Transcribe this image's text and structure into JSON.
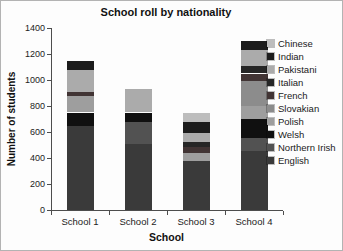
{
  "chart_data": {
    "type": "bar",
    "stacked": true,
    "title": "School roll by nationality",
    "xlabel": "School",
    "ylabel": "Number of students",
    "ylim": [
      0,
      1400
    ],
    "y_ticks": [
      1400,
      1200,
      1000,
      800,
      600,
      400,
      200,
      0
    ],
    "grid": false,
    "legend_position": "right",
    "legend_order_top_to_bottom": [
      "Chinese",
      "Indian",
      "Pakistani",
      "Italian",
      "French",
      "Slovakian",
      "Polish",
      "Welsh",
      "Northern Irish",
      "English"
    ],
    "categories": [
      "School 1",
      "School 2",
      "School 3",
      "School 4"
    ],
    "series": [
      {
        "name": "English",
        "color": "#3a3a3a",
        "values": [
          650,
          510,
          380,
          455
        ]
      },
      {
        "name": "Northern Irish",
        "color": "#525252",
        "values": [
          0,
          165,
          0,
          100
        ]
      },
      {
        "name": "Welsh",
        "color": "#101010",
        "values": [
          100,
          75,
          0,
          145
        ]
      },
      {
        "name": "Polish",
        "color": "#9e9e9e",
        "values": [
          130,
          0,
          60,
          100
        ]
      },
      {
        "name": "Slovakian",
        "color": "#8c8c8c",
        "values": [
          0,
          0,
          0,
          190
        ]
      },
      {
        "name": "French",
        "color": "#413434",
        "values": [
          30,
          0,
          45,
          60
        ]
      },
      {
        "name": "Italian",
        "color": "#262626",
        "values": [
          0,
          0,
          40,
          55
        ]
      },
      {
        "name": "Pakistani",
        "color": "#ababab",
        "values": [
          165,
          180,
          70,
          125
        ]
      },
      {
        "name": "Indian",
        "color": "#1c1c1c",
        "values": [
          75,
          0,
          85,
          70
        ]
      },
      {
        "name": "Chinese",
        "color": "#bdbdbd",
        "values": [
          0,
          0,
          70,
          0
        ]
      }
    ]
  }
}
